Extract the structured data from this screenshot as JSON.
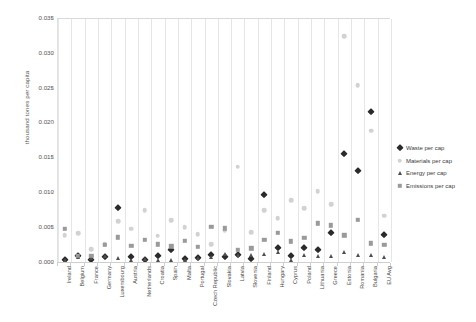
{
  "chart_data": {
    "type": "scatter",
    "title": "",
    "xlabel": "",
    "ylabel": "thousand tones per capita",
    "ylim": [
      0.0,
      0.035
    ],
    "ytick_values": [
      0.0,
      0.005,
      0.01,
      0.015,
      0.02,
      0.025,
      0.03,
      0.035
    ],
    "ytick_labels": [
      "0.000",
      "0.005",
      "0.010",
      "0.015",
      "0.020",
      "0.025",
      "0.030",
      "0.035"
    ],
    "grid": "vertical-category-separators",
    "legend_position": "right",
    "categories": [
      "Ireland",
      "Belgium",
      "France",
      "Germany",
      "Luxembourg",
      "Austria",
      "Netherlands",
      "Croatia",
      "Spain",
      "Malta",
      "Portugal",
      "Czech Republic",
      "Slovakia",
      "Latvia",
      "Slovenia",
      "Finland",
      "Hungary",
      "Cyprus",
      "Poland",
      "Lithuania",
      "Greece",
      "Estonia",
      "Romania",
      "Bulgaria",
      "EU Avg"
    ],
    "series": [
      {
        "name": "Waste per cap",
        "marker": "diamond",
        "color": "#2b2b2b",
        "values": [
          0.0004,
          0.001,
          0.0005,
          0.0009,
          0.0079,
          0.0008,
          0.0004,
          0.001,
          0.0019,
          0.0006,
          0.0007,
          0.0011,
          0.0009,
          0.0012,
          0.0006,
          0.0097,
          0.0022,
          0.001,
          0.0021,
          0.0018,
          0.0043,
          0.0156,
          0.0132,
          0.0216,
          0.004
        ]
      },
      {
        "name": "Materials per cap",
        "marker": "circle",
        "color": "#d2d2d2",
        "values": [
          0.004,
          0.0043,
          0.002,
          0.0027,
          0.006,
          0.0049,
          0.0076,
          0.0039,
          0.0061,
          0.0051,
          0.0041,
          0.0027,
          0.0047,
          0.0138,
          0.0044,
          0.0076,
          0.0064,
          0.009,
          0.0079,
          0.0103,
          0.0084,
          0.0325,
          0.0255,
          0.019,
          0.0068
        ]
      },
      {
        "name": "Energy per cap",
        "marker": "triangle",
        "color": "#4e4e4e",
        "values": [
          0.0005,
          0.0008,
          0.0007,
          0.001,
          0.0007,
          0.0005,
          0.0006,
          0.0005,
          0.0005,
          0.0004,
          0.0007,
          0.0009,
          0.0013,
          0.0011,
          0.0011,
          0.0013,
          0.0016,
          0.0005,
          0.0011,
          0.001,
          0.001,
          0.0016,
          0.0011,
          0.0012,
          0.0009
        ]
      },
      {
        "name": "Emissions per cap",
        "marker": "square",
        "color": "#9a9a9a",
        "values": [
          0.0049,
          0.001,
          0.001,
          0.0026,
          0.0037,
          0.0025,
          0.0033,
          0.0027,
          0.0024,
          0.0032,
          0.0023,
          0.0052,
          0.005,
          0.0019,
          0.0021,
          0.0033,
          0.0043,
          0.0031,
          0.0036,
          0.0057,
          0.0054,
          0.004,
          0.0062,
          0.0028,
          0.0026
        ]
      }
    ]
  },
  "legend": {
    "items": [
      {
        "label": "Waste per cap",
        "marker": "diamond"
      },
      {
        "label": "Materials per cap",
        "marker": "circle"
      },
      {
        "label": "Energy per cap",
        "marker": "triangle"
      },
      {
        "label": "Emissions per cap",
        "marker": "square"
      }
    ]
  }
}
